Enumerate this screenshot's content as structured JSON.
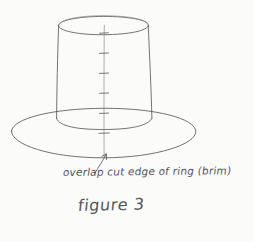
{
  "page": {
    "background_color": "#fbfbfa",
    "ink_color": "#5a5a5c",
    "medium": "pencil-sketch"
  },
  "drawing": {
    "subject": "top hat form: cylinder crown on elliptical brim",
    "crown": {
      "label": "cylinder-crown",
      "top_ellipse_center_x": 103,
      "top_ellipse_center_y": 26,
      "top_ellipse_rx": 45,
      "top_ellipse_ry": 8,
      "bottom_y": 122,
      "left_wall_top_x": 58,
      "left_wall_bottom_x": 56,
      "right_wall_top_x": 148,
      "right_wall_bottom_x": 152
    },
    "brim": {
      "label": "brim-ellipse",
      "center_x": 103,
      "center_y": 133,
      "rx": 92,
      "ry": 25
    },
    "seam": {
      "label": "overlap-seam-line",
      "x": 104,
      "top_y": 25,
      "bottom_y": 158,
      "tick_positions_y": [
        33,
        53,
        73,
        93,
        113,
        133
      ],
      "tick_half_width": 4
    },
    "arrow": {
      "label": "pointer-arrow",
      "tail_x": 95,
      "tail_y": 173,
      "head_x": 106,
      "head_y": 154
    }
  },
  "annotations": {
    "callout_text": "overlap cut edge of ring (brim)",
    "caption_text": "figure 3"
  }
}
